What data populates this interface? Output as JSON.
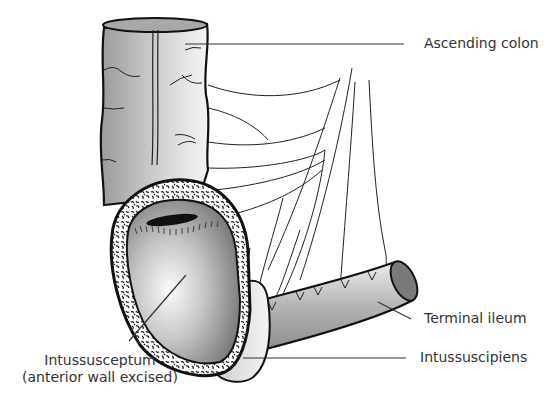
{
  "figure": {
    "type": "anatomical illustration",
    "colors": {
      "outline": "#111111",
      "bowel_fill_light": "#f2f2f2",
      "bowel_fill_dark": "#8c8c8c",
      "serosa_speckle_bg": "#ffffff",
      "leader_line": "#333333",
      "text": "#333333"
    }
  },
  "labels": {
    "ascending_colon": "Ascending colon",
    "terminal_ileum": "Terminal ileum",
    "intussuscipiens": "Intussuscipiens",
    "intussusceptum_line1": "Intussusceptum",
    "intussusceptum_line2": "(anterior wall excised)"
  }
}
